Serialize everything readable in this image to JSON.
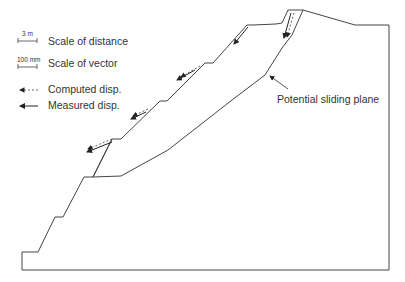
{
  "figure": {
    "type": "slope cross-section with displacement vectors",
    "legend": {
      "distance_scale": {
        "label": "Scale of distance",
        "value": "3 m"
      },
      "vector_scale": {
        "label": "Scale of vector",
        "value": "100 mm"
      },
      "computed": {
        "label": "Computed disp.",
        "style": "dashed"
      },
      "measured": {
        "label": "Measured disp.",
        "style": "solid"
      }
    },
    "annotation": {
      "label": "Potential sliding plane"
    },
    "colors": {
      "line": "#444444",
      "text": "#333333"
    }
  }
}
